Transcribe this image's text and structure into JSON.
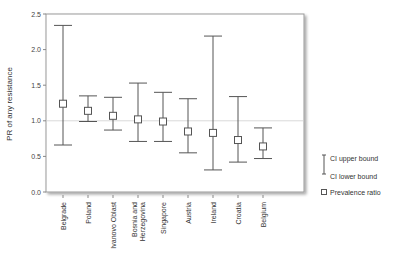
{
  "chart_data": {
    "type": "errorbar",
    "title": "",
    "xlabel": "",
    "ylabel": "PR of any resistance",
    "ylim": [
      0.0,
      2.5
    ],
    "yticks": [
      "0.0",
      "0.5",
      "1.0",
      "1.5",
      "2.0",
      "2.5"
    ],
    "reference_line": 1.0,
    "grid": false,
    "legend_position": "right",
    "categories": [
      "Belgrade",
      "Poland",
      "Ivanovo Oblast",
      "Bosnia and Herzegovina",
      "Singapore",
      "Austria",
      "Ireland",
      "Croatia",
      "Belgium"
    ],
    "series": [
      {
        "name": "Prevalence ratio",
        "values": [
          1.24,
          1.14,
          1.07,
          1.02,
          0.99,
          0.85,
          0.83,
          0.73,
          0.64
        ]
      },
      {
        "name": "CI upper bound",
        "values": [
          2.34,
          1.35,
          1.33,
          1.53,
          1.4,
          1.31,
          2.19,
          1.34,
          0.9
        ]
      },
      {
        "name": "CI lower bound",
        "values": [
          0.66,
          0.99,
          0.87,
          0.71,
          0.71,
          0.55,
          0.31,
          0.42,
          0.47
        ]
      }
    ]
  },
  "legend": {
    "upper": "CI upper bound",
    "lower": "CI lower bound",
    "ratio": "Prevalence ratio"
  },
  "colors": {
    "bars": "#555555",
    "axis": "#888888",
    "reference": "#d9d9d9"
  }
}
